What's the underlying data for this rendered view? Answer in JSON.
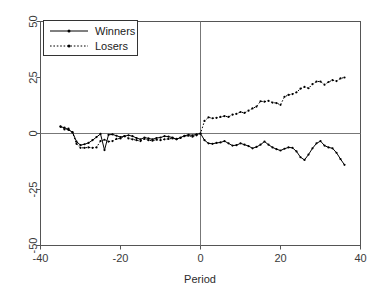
{
  "chart_data": {
    "type": "line",
    "title": "",
    "xlabel": "Period",
    "ylabel": "",
    "xlim": [
      -40,
      40
    ],
    "ylim": [
      -50,
      50
    ],
    "xticks": [
      -40,
      -20,
      0,
      20,
      40
    ],
    "yticks": [
      -50,
      -25,
      0,
      25,
      50
    ],
    "xtick_labels": [
      "-40",
      "-20",
      "0",
      "20",
      "40"
    ],
    "ytick_labels": [
      "-50",
      "-25",
      "0",
      "25",
      "50"
    ],
    "grid": false,
    "legend_position": "top-left",
    "annotations": [
      {
        "name": "zero-horizontal-line",
        "type": "hline",
        "value": 0
      },
      {
        "name": "event-vertical-line",
        "type": "vline",
        "value": 0
      }
    ],
    "series": [
      {
        "name": "Winners",
        "style": "solid",
        "marker": "dot",
        "color": "#000000",
        "x": [
          -35,
          -34,
          -33,
          -32,
          -31,
          -30,
          -29,
          -28,
          -27,
          -26,
          -25,
          -24,
          -23,
          -22,
          -21,
          -20,
          -19,
          -18,
          -17,
          -16,
          -15,
          -14,
          -13,
          -12,
          -11,
          -10,
          -9,
          -8,
          -7,
          -6,
          -5,
          -4,
          -3,
          -2,
          -1,
          0,
          1,
          2,
          3,
          4,
          5,
          6,
          7,
          8,
          9,
          10,
          11,
          12,
          13,
          14,
          15,
          16,
          17,
          18,
          19,
          20,
          21,
          22,
          23,
          24,
          25,
          26,
          27,
          28,
          29,
          30,
          31,
          32,
          33,
          34,
          35,
          36
        ],
        "values": [
          3.0,
          2.6,
          1.6,
          0.6,
          -3.6,
          -5.2,
          -4.8,
          -4.2,
          -3.0,
          -1.6,
          -0.2,
          -7.4,
          -0.6,
          -0.4,
          -1.0,
          -1.6,
          -1.2,
          -0.8,
          -1.2,
          -2.0,
          -2.6,
          -1.8,
          -2.2,
          -2.6,
          -2.0,
          -1.8,
          -1.2,
          -1.4,
          -1.8,
          -2.6,
          -1.8,
          -1.0,
          -0.6,
          -0.8,
          -0.4,
          0.0,
          -3.0,
          -4.4,
          -4.6,
          -4.2,
          -4.0,
          -3.4,
          -4.4,
          -5.4,
          -5.2,
          -4.4,
          -5.0,
          -5.6,
          -6.6,
          -6.0,
          -5.0,
          -3.6,
          -5.0,
          -6.2,
          -7.0,
          -7.6,
          -6.8,
          -6.2,
          -6.4,
          -8.0,
          -10.6,
          -11.8,
          -9.4,
          -6.6,
          -4.4,
          -3.4,
          -5.4,
          -6.2,
          -6.6,
          -8.6,
          -11.4,
          -14.0
        ]
      },
      {
        "name": "Losers",
        "style": "dotted",
        "marker": "dot",
        "color": "#000000",
        "x": [
          -35,
          -34,
          -33,
          -32,
          -31,
          -30,
          -29,
          -28,
          -27,
          -26,
          -25,
          -24,
          -23,
          -22,
          -21,
          -20,
          -19,
          -18,
          -17,
          -16,
          -15,
          -14,
          -13,
          -12,
          -11,
          -10,
          -9,
          -8,
          -7,
          -6,
          -5,
          -4,
          -3,
          -2,
          -1,
          0,
          1,
          2,
          3,
          4,
          5,
          6,
          7,
          8,
          9,
          10,
          11,
          12,
          13,
          14,
          15,
          16,
          17,
          18,
          19,
          20,
          21,
          22,
          23,
          24,
          25,
          26,
          27,
          28,
          29,
          30,
          31,
          32,
          33,
          34,
          35,
          36
        ],
        "values": [
          3.2,
          1.8,
          2.2,
          0.4,
          -4.6,
          -6.4,
          -6.4,
          -6.2,
          -6.4,
          -6.2,
          -3.4,
          -2.8,
          -3.6,
          -3.4,
          -2.4,
          -2.2,
          -1.2,
          -2.2,
          -2.6,
          -3.0,
          -3.4,
          -2.4,
          -3.0,
          -3.2,
          -2.8,
          -3.0,
          -2.6,
          -2.4,
          -2.2,
          -2.4,
          -2.0,
          -1.2,
          -1.0,
          -1.4,
          -0.8,
          0.0,
          5.6,
          7.2,
          6.8,
          7.0,
          7.4,
          7.8,
          7.4,
          8.4,
          8.8,
          9.6,
          9.2,
          10.2,
          11.2,
          12.0,
          14.4,
          14.2,
          14.6,
          13.8,
          13.6,
          12.8,
          16.4,
          17.2,
          17.6,
          18.4,
          20.0,
          20.8,
          20.2,
          22.0,
          23.2,
          23.2,
          21.8,
          23.0,
          23.8,
          23.4,
          24.6,
          25.0
        ]
      }
    ]
  },
  "legend": {
    "items": [
      {
        "label": "Winners",
        "style": "solid"
      },
      {
        "label": "Losers",
        "style": "dotted"
      }
    ]
  },
  "axes": {
    "x_title": "Period"
  }
}
